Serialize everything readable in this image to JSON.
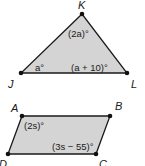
{
  "triangle": {
    "vertices": [
      {
        "name": "K",
        "x": 82,
        "y": 14
      },
      {
        "name": "J",
        "x": 21,
        "y": 73
      },
      {
        "name": "L",
        "x": 127,
        "y": 73
      }
    ],
    "angles": {
      "K": "(2a)°",
      "J": "a°",
      "L": "(a + 10)°"
    },
    "fill": "#d4d4d4",
    "stroke": "#1a1a1a"
  },
  "parallelogram": {
    "vertices": [
      {
        "name": "A",
        "x": 22,
        "y": 116
      },
      {
        "name": "B",
        "x": 110,
        "y": 116
      },
      {
        "name": "C",
        "x": 96,
        "y": 154
      },
      {
        "name": "D",
        "x": 8,
        "y": 154
      }
    ],
    "angles": {
      "A": "(2s)°",
      "C": "(3s − 55)°"
    },
    "fill": "#d4d4d4",
    "stroke": "#1a1a1a"
  }
}
